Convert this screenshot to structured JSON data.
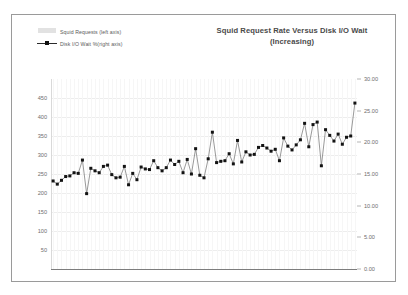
{
  "chart": {
    "title": "Squid Request Rate Versus Disk I/O Wait (Increasing)",
    "title_line1": "Squid Request Rate Versus Disk I/O Wait",
    "title_line2": "(Increasing)",
    "legend": [
      {
        "label": "Squid Requests (left axis)",
        "marker": "area-swatch",
        "color": "#e2e2e2"
      },
      {
        "label": "Disk I/O Wait %(right axis)",
        "marker": "line-square-marker",
        "color": "#111111"
      }
    ],
    "left_axis_ticks": [
      "450",
      "400",
      "350",
      "300",
      "250",
      "200",
      "150",
      "100",
      "50"
    ],
    "right_axis_ticks": [
      "30.00",
      "25.00",
      "20.00",
      "15.00",
      "10.00",
      "5.00",
      "0.00"
    ]
  },
  "chart_data": {
    "type": "line",
    "title": "Squid Request Rate Versus Disk I/O Wait (Increasing)",
    "xlabel": "",
    "ylabel": "Squid Requests",
    "y2label": "Disk I/O Wait %",
    "ylim": [
      0,
      500
    ],
    "y2lim": [
      0.0,
      30.0
    ],
    "yticks": [
      50,
      100,
      150,
      200,
      250,
      300,
      350,
      400,
      450
    ],
    "y2ticks": [
      0.0,
      5.0,
      10.0,
      15.0,
      20.0,
      25.0,
      30.0
    ],
    "grid": true,
    "legend_position": "top-left",
    "series": [
      {
        "name": "Squid Requests (left axis)",
        "axis": "left",
        "type": "area",
        "color": "#e2e2e2",
        "note": "series not visible in plot area; only present in legend",
        "values": []
      },
      {
        "name": "Disk I/O Wait %(right axis)",
        "axis": "right",
        "type": "line",
        "marker": "square",
        "color": "#111111",
        "values": [
          13.9,
          13.4,
          14.0,
          14.6,
          14.7,
          15.2,
          15.1,
          17.2,
          11.9,
          15.9,
          15.5,
          15.2,
          16.2,
          16.4,
          14.9,
          14.4,
          14.5,
          16.2,
          13.3,
          15.1,
          14.1,
          16.1,
          15.8,
          15.7,
          17.1,
          16.0,
          15.5,
          16.0,
          17.2,
          16.5,
          17.0,
          15.2,
          17.3,
          15.0,
          19.0,
          14.8,
          14.4,
          17.4,
          21.6,
          16.8,
          17.0,
          17.1,
          18.2,
          16.6,
          20.3,
          16.9,
          18.5,
          18.0,
          18.1,
          19.2,
          19.5,
          19.1,
          18.6,
          18.9,
          17.1,
          20.7,
          19.4,
          18.8,
          19.6,
          20.4,
          23.0,
          19.3,
          22.8,
          23.2,
          16.3,
          22.0,
          21.1,
          20.2,
          21.3,
          19.7,
          20.8,
          21.0,
          26.2
        ]
      }
    ]
  }
}
